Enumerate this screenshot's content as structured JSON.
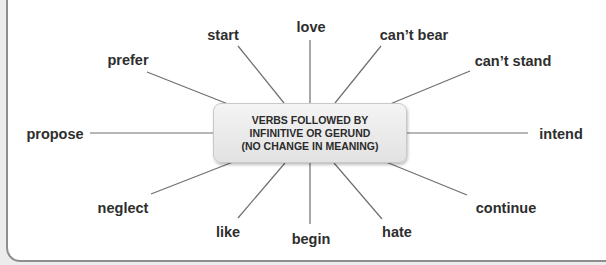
{
  "diagram": {
    "center": {
      "line1": "VERBS FOLLOWED BY",
      "line2": "INFINITIVE OR GERUND",
      "line3": "(NO CHANGE IN MEANING)"
    },
    "verbs": {
      "love": "love",
      "start": "start",
      "cant_bear": "can’t bear",
      "prefer": "prefer",
      "cant_stand": "can’t stand",
      "propose": "propose",
      "intend": "intend",
      "neglect": "neglect",
      "continue": "continue",
      "like": "like",
      "begin": "begin",
      "hate": "hate"
    }
  },
  "colors": {
    "line": "#6f6f6f",
    "text": "#2e2e2e",
    "box_top": "#f4f4f4",
    "box_bottom": "#e2e2e2",
    "frame_border": "#8e8e8e"
  }
}
